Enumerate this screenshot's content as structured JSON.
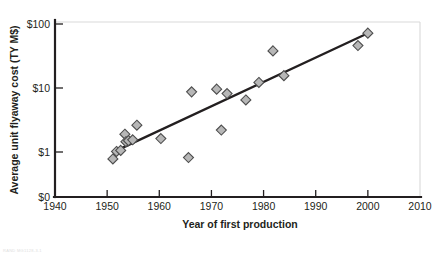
{
  "chart_data": {
    "type": "scatter",
    "title": "",
    "xlabel": "Year of first production",
    "ylabel": "Average unit flyaway cost (TY M$)",
    "xlim": [
      1940,
      2010
    ],
    "xticks": [
      "1940",
      "1950",
      "1960",
      "1970",
      "1980",
      "1990",
      "2000",
      "2010"
    ],
    "xtick_values": [
      1940,
      1950,
      1960,
      1970,
      1980,
      1990,
      2000,
      2010
    ],
    "yscale": "log",
    "ylim": [
      1,
      100
    ],
    "yticks": [
      "$0",
      "$1",
      "$10",
      "$100"
    ],
    "ytick_values": [
      0,
      1,
      10,
      100
    ],
    "grid": false,
    "legend": null,
    "marker_shape": "diamond",
    "marker_fill": "#b7b7b7",
    "marker_edge": "#4d4d4d",
    "trendline": {
      "label": "linear fit (log scale)",
      "color": "#231f20",
      "x_start": 1952.8,
      "y_start": 1.15,
      "x_end": 2000.2,
      "y_end": 73.0
    },
    "points": [
      {
        "x": 1951.1,
        "y": 0.78
      },
      {
        "x": 1951.8,
        "y": 1.02
      },
      {
        "x": 1952.6,
        "y": 1.06
      },
      {
        "x": 1953.4,
        "y": 1.9
      },
      {
        "x": 1953.6,
        "y": 1.45
      },
      {
        "x": 1954.1,
        "y": 1.5
      },
      {
        "x": 1954.9,
        "y": 1.55
      },
      {
        "x": 1955.7,
        "y": 2.62
      },
      {
        "x": 1960.3,
        "y": 1.62
      },
      {
        "x": 1965.6,
        "y": 0.82
      },
      {
        "x": 1966.2,
        "y": 8.7
      },
      {
        "x": 1971.0,
        "y": 9.6
      },
      {
        "x": 1971.9,
        "y": 2.2
      },
      {
        "x": 1973.0,
        "y": 8.2
      },
      {
        "x": 1976.6,
        "y": 6.5
      },
      {
        "x": 1979.1,
        "y": 12.2
      },
      {
        "x": 1981.8,
        "y": 38.0
      },
      {
        "x": 1983.9,
        "y": 15.6
      },
      {
        "x": 1998.1,
        "y": 46.0
      },
      {
        "x": 2000.0,
        "y": 72.0
      }
    ]
  },
  "footer": {
    "watermark": "RAND MG1128-3.1"
  }
}
